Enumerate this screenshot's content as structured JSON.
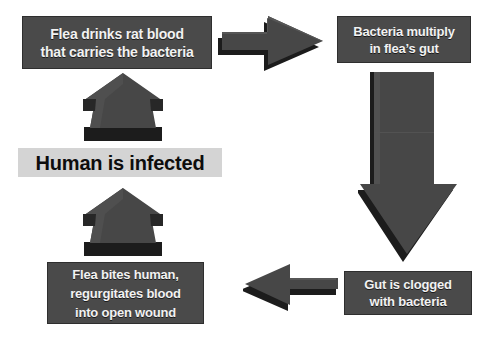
{
  "diagram": {
    "background_color": "#ffffff",
    "node_fill_dark": "#4a4a4a",
    "node_fill_light": "#d4d4d4",
    "node_text_light": "#f2f2f2",
    "node_text_dark": "#0d0d0d",
    "arrow_face_color": "#4a4a4a",
    "arrow_shadow_color": "#1c1c1c"
  },
  "nodes": {
    "flea_drinks": {
      "line1": "Flea drinks rat blood",
      "line2": "that carries the bacteria"
    },
    "bacteria_multiply": {
      "line1": "Bacteria multiply",
      "line2": "in flea’s gut"
    },
    "gut_clogged": {
      "line1": "Gut is clogged",
      "line2": "with bacteria"
    },
    "flea_bites": {
      "line1": "Flea bites human,",
      "line2": "regurgitates blood",
      "line3": "into open wound"
    },
    "human_infected": {
      "line1": "Human is infected"
    }
  },
  "arrows": {
    "right_top": {
      "icon": "arrow-right-icon",
      "direction": "right"
    },
    "down_right": {
      "icon": "arrow-down-icon",
      "direction": "down"
    },
    "left_bottom": {
      "icon": "arrow-left-icon",
      "direction": "left"
    },
    "up_lower": {
      "icon": "arrow-up-icon",
      "direction": "up"
    },
    "up_upper": {
      "icon": "arrow-up-icon",
      "direction": "up"
    }
  }
}
